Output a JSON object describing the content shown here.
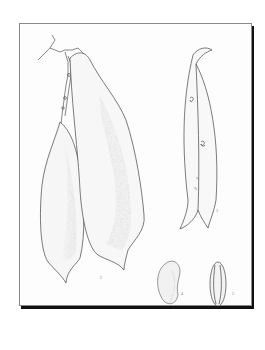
{
  "image": {
    "subject": "Botanical illustration of bean pods and seeds",
    "background_color": "#ffffff",
    "plate_border_color": "#8a8a8a",
    "shadow_color": "#111111",
    "ink_color": "#3a3a3a",
    "figures": [
      {
        "id": "pod-left",
        "description": "Long hanging bean pod, left"
      },
      {
        "id": "pod-center",
        "description": "Large curved bean pod with shaded center, attached to stem"
      },
      {
        "id": "pod-right",
        "description": "Split/opening pod with seeds visible along suture"
      },
      {
        "id": "seed-kidney",
        "description": "Kidney-shaped bean seed"
      },
      {
        "id": "seed-side",
        "description": "Oval seed, edge view"
      }
    ],
    "labels": [
      "2",
      "3",
      "4",
      "5"
    ]
  }
}
